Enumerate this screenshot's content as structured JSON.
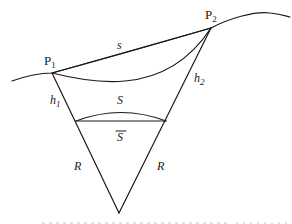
{
  "diagram": {
    "type": "geodetic-reduction-figure",
    "labels": {
      "p1": "P",
      "p1_sub": "1",
      "p2": "P",
      "p2_sub": "2",
      "chord": "s",
      "h1": "h",
      "h1_sub": "1",
      "h2": "h",
      "h2_sub": "2",
      "arc": "S",
      "chord_bar": "S",
      "radius_left": "R",
      "radius_right": "R"
    },
    "colors": {
      "line": "#1a1a1a",
      "background": "#ffffff"
    }
  }
}
